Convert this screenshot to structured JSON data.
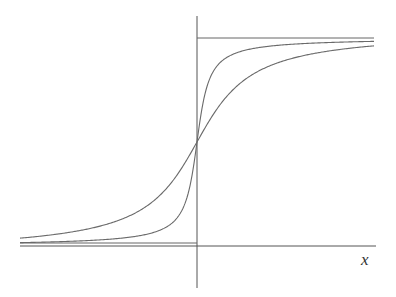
{
  "chart_data": {
    "type": "line",
    "title": "",
    "xlabel": "x",
    "ylabel": "",
    "grid": false,
    "legend": null,
    "axes": {
      "x_axis": {
        "y_px": 246,
        "x_from_px": 20,
        "x_to_px": 376
      },
      "y_axis": {
        "x_px": 197,
        "y_from_px": 16,
        "y_to_px": 288
      }
    },
    "asymptotes": [
      {
        "name": "upper",
        "y_px": 38,
        "x_from_px": 197,
        "x_to_px": 374
      },
      {
        "name": "lower",
        "y_px": 243,
        "x_from_px": 20,
        "x_to_px": 197
      }
    ],
    "center_px": [
      197,
      142
    ],
    "series": [
      {
        "name": "steep-sigmoid",
        "form": "arctan",
        "amplitude_px": 104,
        "scale_px": 9,
        "x_from_px": 20,
        "x_to_px": 374
      },
      {
        "name": "shallow-sigmoid",
        "form": "arctan",
        "amplitude_px": 112,
        "scale_px": 40,
        "x_from_px": 20,
        "x_to_px": 374
      }
    ],
    "annotations": []
  },
  "labels": {
    "x_axis_label": "x"
  }
}
